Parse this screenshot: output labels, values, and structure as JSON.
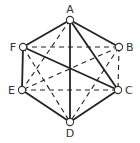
{
  "diagram": {
    "type": "graph",
    "shape": "hexagon",
    "colors": {
      "line": "#222222",
      "node_fill": "#ffffff",
      "node_stroke": "#333333",
      "label": "#333333",
      "background": "#ffffff"
    },
    "vertices": [
      {
        "id": "A",
        "label": "A",
        "x": 70,
        "y": 20,
        "lx": 70,
        "ly": 13,
        "anchor": "middle"
      },
      {
        "id": "B",
        "label": "B",
        "x": 119,
        "y": 47,
        "lx": 126,
        "ly": 51,
        "anchor": "start"
      },
      {
        "id": "C",
        "label": "C",
        "x": 118,
        "y": 90,
        "lx": 125,
        "ly": 94,
        "anchor": "start"
      },
      {
        "id": "D",
        "label": "D",
        "x": 70,
        "y": 122,
        "lx": 70,
        "ly": 137,
        "anchor": "middle"
      },
      {
        "id": "E",
        "label": "E",
        "x": 22,
        "y": 90,
        "lx": 15,
        "ly": 94,
        "anchor": "end"
      },
      {
        "id": "F",
        "label": "F",
        "x": 23,
        "y": 47,
        "lx": 16,
        "ly": 51,
        "anchor": "end"
      }
    ],
    "solid_edges": [
      [
        "A",
        "F"
      ],
      [
        "A",
        "B"
      ],
      [
        "A",
        "D"
      ],
      [
        "A",
        "C"
      ],
      [
        "F",
        "C"
      ],
      [
        "F",
        "E"
      ],
      [
        "E",
        "D"
      ],
      [
        "D",
        "C"
      ]
    ],
    "dashed_edges": [
      [
        "F",
        "B"
      ],
      [
        "E",
        "C"
      ],
      [
        "B",
        "C"
      ],
      [
        "A",
        "E"
      ],
      [
        "B",
        "E"
      ],
      [
        "F",
        "D"
      ],
      [
        "B",
        "D"
      ]
    ]
  }
}
